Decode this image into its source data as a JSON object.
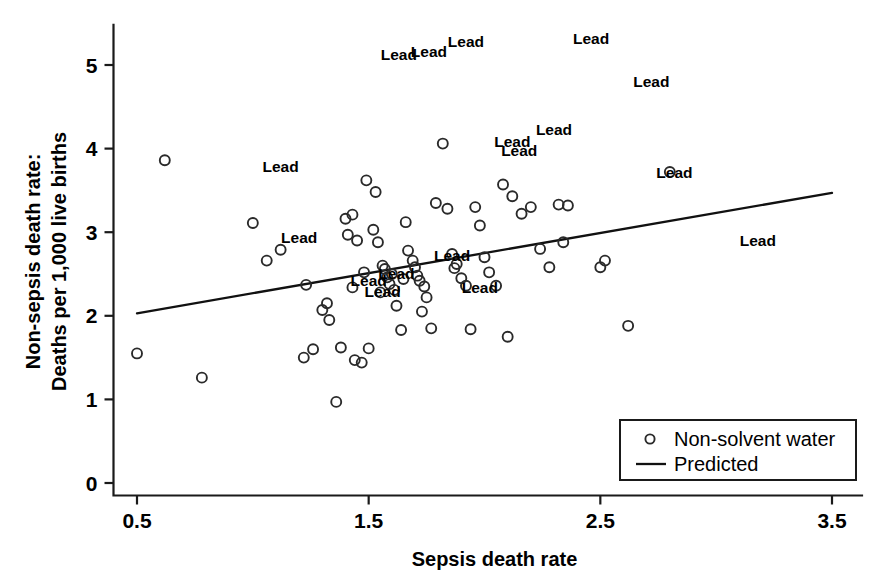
{
  "chart_data": {
    "type": "scatter",
    "title": "",
    "xlabel": "Sepsis death rate",
    "ylabel_line1": "Non-sepsis death rate:",
    "ylabel_line2": "Deaths per 1,000 live births",
    "xlim": [
      0.32,
      3.68
    ],
    "ylim": [
      -0.18,
      5.55
    ],
    "xticks": [
      0.5,
      1.5,
      2.5,
      3.5
    ],
    "xticklabels": [
      "0.5",
      "1.5",
      "2.5",
      "3.5"
    ],
    "yticks": [
      0,
      1,
      2,
      3,
      4,
      5
    ],
    "yticklabels": [
      "0",
      "1",
      "2",
      "3",
      "4",
      "5"
    ],
    "grid": false,
    "legend_position": "lower right",
    "legend": [
      {
        "label": "Non-solvent water",
        "marker": "open-circle"
      },
      {
        "label": "Predicted",
        "marker": "line"
      }
    ],
    "series": [
      {
        "name": "Non-solvent water",
        "marker": "open-circle",
        "points": [
          [
            0.5,
            1.55
          ],
          [
            0.62,
            3.86
          ],
          [
            0.78,
            1.26
          ],
          [
            1.0,
            3.11
          ],
          [
            1.06,
            2.66
          ],
          [
            1.12,
            2.79
          ],
          [
            1.23,
            2.37
          ],
          [
            1.22,
            1.5
          ],
          [
            1.26,
            1.6
          ],
          [
            1.3,
            2.07
          ],
          [
            1.32,
            2.15
          ],
          [
            1.33,
            1.95
          ],
          [
            1.36,
            0.97
          ],
          [
            1.38,
            1.62
          ],
          [
            1.4,
            3.16
          ],
          [
            1.43,
            3.21
          ],
          [
            1.41,
            2.97
          ],
          [
            1.45,
            2.9
          ],
          [
            1.44,
            1.47
          ],
          [
            1.47,
            1.44
          ],
          [
            1.5,
            1.61
          ],
          [
            1.49,
            3.62
          ],
          [
            1.53,
            3.48
          ],
          [
            1.52,
            3.03
          ],
          [
            1.54,
            2.88
          ],
          [
            1.56,
            2.6
          ],
          [
            1.57,
            2.56
          ],
          [
            1.58,
            2.46
          ],
          [
            1.6,
            2.5
          ],
          [
            1.59,
            2.38
          ],
          [
            1.61,
            2.31
          ],
          [
            1.62,
            2.12
          ],
          [
            1.64,
            1.83
          ],
          [
            1.66,
            3.12
          ],
          [
            1.67,
            2.78
          ],
          [
            1.69,
            2.66
          ],
          [
            1.7,
            2.58
          ],
          [
            1.71,
            2.48
          ],
          [
            1.72,
            2.42
          ],
          [
            1.74,
            2.35
          ],
          [
            1.75,
            2.22
          ],
          [
            1.73,
            2.05
          ],
          [
            1.77,
            1.85
          ],
          [
            1.79,
            3.35
          ],
          [
            1.82,
            4.06
          ],
          [
            1.84,
            3.28
          ],
          [
            1.86,
            2.74
          ],
          [
            1.88,
            2.62
          ],
          [
            1.9,
            2.45
          ],
          [
            1.92,
            2.36
          ],
          [
            1.94,
            1.84
          ],
          [
            1.96,
            3.3
          ],
          [
            1.98,
            3.08
          ],
          [
            2.0,
            2.7
          ],
          [
            2.02,
            2.52
          ],
          [
            2.05,
            2.36
          ],
          [
            2.08,
            3.57
          ],
          [
            2.12,
            3.43
          ],
          [
            2.16,
            3.22
          ],
          [
            2.2,
            3.3
          ],
          [
            2.24,
            2.8
          ],
          [
            2.28,
            2.58
          ],
          [
            2.1,
            1.75
          ],
          [
            2.32,
            3.33
          ],
          [
            2.36,
            3.32
          ],
          [
            2.34,
            2.88
          ],
          [
            2.52,
            2.66
          ],
          [
            2.5,
            2.58
          ],
          [
            2.62,
            1.88
          ],
          [
            2.8,
            3.72
          ],
          [
            1.87,
            2.57
          ],
          [
            1.65,
            2.44
          ],
          [
            1.55,
            2.28
          ],
          [
            1.48,
            2.52
          ],
          [
            1.43,
            2.34
          ]
        ]
      }
    ],
    "fit_line": {
      "name": "Predicted",
      "x": [
        0.5,
        3.5
      ],
      "y": [
        2.03,
        3.47
      ]
    },
    "annotations": [
      {
        "text": "Lead",
        "x": 1.92,
        "y": 5.28
      },
      {
        "text": "Lead",
        "x": 1.63,
        "y": 5.12
      },
      {
        "text": "Lead",
        "x": 1.76,
        "y": 5.16
      },
      {
        "text": "Lead",
        "x": 2.46,
        "y": 5.31
      },
      {
        "text": "Lead",
        "x": 2.72,
        "y": 4.8
      },
      {
        "text": "Lead",
        "x": 2.3,
        "y": 4.22
      },
      {
        "text": "Lead",
        "x": 2.12,
        "y": 4.08
      },
      {
        "text": "Lead",
        "x": 2.15,
        "y": 3.97
      },
      {
        "text": "Lead",
        "x": 1.12,
        "y": 3.78
      },
      {
        "text": "Lead",
        "x": 2.82,
        "y": 3.71
      },
      {
        "text": "Lead",
        "x": 1.2,
        "y": 2.93
      },
      {
        "text": "Lead",
        "x": 3.18,
        "y": 2.89
      },
      {
        "text": "Lead",
        "x": 1.86,
        "y": 2.72
      },
      {
        "text": "Lead",
        "x": 1.62,
        "y": 2.5
      },
      {
        "text": "Lead",
        "x": 1.5,
        "y": 2.42
      },
      {
        "text": "Lead",
        "x": 1.56,
        "y": 2.28
      },
      {
        "text": "Lead",
        "x": 1.98,
        "y": 2.33
      }
    ]
  }
}
